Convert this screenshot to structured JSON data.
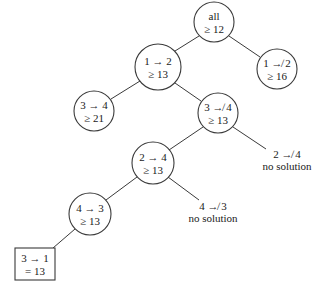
{
  "diagram": {
    "type": "branch-and-bound-tree",
    "nodes": [
      {
        "id": "all",
        "line1": "all",
        "line2": "≥ 12",
        "shape": "circle",
        "cx": 214,
        "cy": 22,
        "r": 20
      },
      {
        "id": "n12",
        "line1": "1 → 2",
        "line2": "≥ 13",
        "shape": "circle",
        "cx": 158,
        "cy": 67,
        "r": 23
      },
      {
        "id": "n1not2",
        "line1": "1 ↛ 2",
        "line2": "≥ 16",
        "shape": "circle",
        "cx": 277,
        "cy": 69,
        "r": 20
      },
      {
        "id": "n34",
        "line1": "3 → 4",
        "line2": "≥ 21",
        "shape": "circle",
        "cx": 94,
        "cy": 111,
        "r": 20
      },
      {
        "id": "n3not4",
        "line1": "3 ↛ 4",
        "line2": "≥ 13",
        "shape": "circle",
        "cx": 218,
        "cy": 113,
        "r": 20
      },
      {
        "id": "n24",
        "line1": "2 → 4",
        "line2": "≥ 13",
        "shape": "circle",
        "cx": 153,
        "cy": 163,
        "r": 21
      },
      {
        "id": "n43",
        "line1": "4 → 3",
        "line2": "≥ 13",
        "shape": "circle",
        "cx": 90,
        "cy": 214,
        "r": 21
      },
      {
        "id": "n31",
        "line1": "3 → 1",
        "line2": "=  13",
        "shape": "box",
        "x": 15,
        "y": 248,
        "w": 40,
        "h": 32
      }
    ],
    "leaves": [
      {
        "id": "n2not4",
        "line1": "2 ↛ 4",
        "line2": "no solution",
        "x": 287,
        "y": 158
      },
      {
        "id": "n4not3",
        "line1": "4 ↛ 3",
        "line2": "no solution",
        "x": 213,
        "y": 210
      }
    ],
    "edges": [
      {
        "from": "all",
        "to": "n12",
        "x1": 199,
        "y1": 36,
        "x2": 175,
        "y2": 51
      },
      {
        "from": "all",
        "to": "n1not2",
        "x1": 229,
        "y1": 36,
        "x2": 260,
        "y2": 57
      },
      {
        "from": "n12",
        "to": "n34",
        "x1": 140,
        "y1": 81,
        "x2": 111,
        "y2": 99
      },
      {
        "from": "n12",
        "to": "n3not4",
        "x1": 175,
        "y1": 83,
        "x2": 201,
        "y2": 101
      },
      {
        "from": "n3not4",
        "to": "n24",
        "x1": 203,
        "y1": 127,
        "x2": 169,
        "y2": 150
      },
      {
        "from": "n3not4",
        "to": "n2not4",
        "x1": 233,
        "y1": 127,
        "x2": 266,
        "y2": 149
      },
      {
        "from": "n24",
        "to": "n43",
        "x1": 137,
        "y1": 177,
        "x2": 106,
        "y2": 200
      },
      {
        "from": "n24",
        "to": "n4not3",
        "x1": 168,
        "y1": 177,
        "x2": 199,
        "y2": 200
      },
      {
        "from": "n43",
        "to": "n31",
        "x1": 75,
        "y1": 229,
        "x2": 53,
        "y2": 248
      }
    ],
    "colors": {
      "stroke": "#3a3a3a",
      "text": "#1a1a1a",
      "background": "#ffffff"
    }
  }
}
